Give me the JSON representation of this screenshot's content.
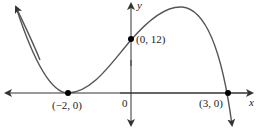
{
  "graph": {
    "axes": {
      "x_label": "x",
      "y_label": "y",
      "origin_label": "0"
    },
    "curve": {
      "type": "polynomial",
      "description": "cubic-like curve touching x-axis at x=-2, crossing y-axis at 12, crossing x-axis at x=3"
    },
    "points": [
      {
        "label": "(−2, 0)",
        "x": -2,
        "y": 0
      },
      {
        "label": "(0, 12)",
        "x": 0,
        "y": 12
      },
      {
        "label": "(3, 0)",
        "x": 3,
        "y": 0
      }
    ],
    "colors": {
      "curve": "#555555",
      "axes": "#333333",
      "points": "#000000"
    }
  }
}
